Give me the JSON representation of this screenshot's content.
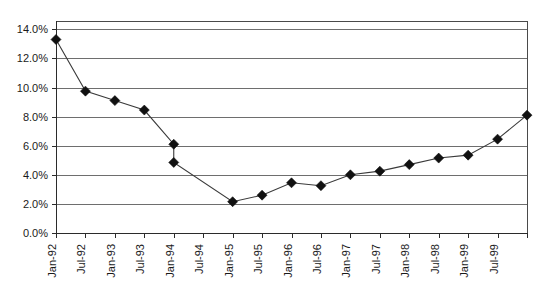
{
  "chart_data": {
    "type": "line",
    "title": "",
    "subtitle": "",
    "xlabel": "",
    "ylabel": "",
    "grid": "horizontal",
    "legend": "none",
    "ylim": [
      0,
      14
    ],
    "ytick_labels": [
      "0.0%",
      "2.0%",
      "4.0%",
      "6.0%",
      "8.0%",
      "10.0%",
      "12.0%",
      "14.0%"
    ],
    "ytick_values": [
      0,
      2,
      4,
      6,
      8,
      10,
      12,
      14
    ],
    "categories": [
      "Jan-92",
      "Jul-92",
      "Jan-93",
      "Jul-93",
      "Jan-94",
      "Jul-94",
      "Jan-95",
      "Jul-95",
      "Jan-96",
      "Jul-96",
      "Jan-97",
      "Jul-97",
      "Jan-98",
      "Jul-98",
      "Jan-99",
      "Jul-99"
    ],
    "series": [
      {
        "name": "Rate",
        "points": [
          {
            "x": 0.0,
            "label": "Jan-92",
            "value": 13.3
          },
          {
            "x": 1.0,
            "label": "Jul-92",
            "value": 9.75
          },
          {
            "x": 2.0,
            "label": "Jan-93",
            "value": 9.1
          },
          {
            "x": 3.0,
            "label": "Jul-93",
            "value": 8.45
          },
          {
            "x": 4.0,
            "label": "Jan-94",
            "value": 6.1
          },
          {
            "x": 4.0,
            "label": "Jan-94",
            "value": 4.85
          },
          {
            "x": 6.0,
            "label": "Jan-95",
            "value": 2.15
          },
          {
            "x": 7.0,
            "label": "Jul-95",
            "value": 2.6
          },
          {
            "x": 8.0,
            "label": "Jan-96",
            "value": 3.45
          },
          {
            "x": 9.0,
            "label": "Jul-96",
            "value": 3.25
          },
          {
            "x": 10.0,
            "label": "Jan-97",
            "value": 4.0
          },
          {
            "x": 11.0,
            "label": "Jul-97",
            "value": 4.25
          },
          {
            "x": 12.0,
            "label": "Jan-98",
            "value": 4.7
          },
          {
            "x": 13.0,
            "label": "Jul-98",
            "value": 5.15
          },
          {
            "x": 14.0,
            "label": "Jan-99",
            "value": 5.35
          },
          {
            "x": 15.0,
            "label": "Jul-99",
            "value": 6.45
          },
          {
            "x": 16.0,
            "label": "",
            "value": 8.1
          }
        ]
      }
    ],
    "colors": {
      "series_line": "#3a3a3a",
      "marker": "#111111",
      "gridline": "#6e6e6e",
      "axis": "#2b2b2b",
      "background": "#ffffff"
    }
  }
}
